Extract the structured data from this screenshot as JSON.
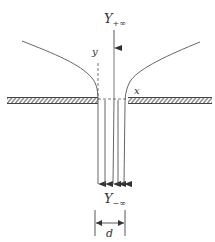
{
  "diagram": {
    "labels": {
      "top_far_field": {
        "main": "Y",
        "sub": "+∞"
      },
      "bottom_far_field": {
        "main": "Y",
        "sub": "−∞"
      },
      "y_axis": "y",
      "x_axis": "x",
      "slit_width": "d"
    },
    "colors": {
      "line": "#555555",
      "hatch": "#444444",
      "background": "#ffffff"
    },
    "elements": {
      "walls": [
        "left-wall",
        "right-wall"
      ],
      "streamlines": 5,
      "arrows": [
        "incoming-arrow-top",
        "outgoing-arrows-bottom"
      ],
      "dimension": "slit width d"
    }
  }
}
